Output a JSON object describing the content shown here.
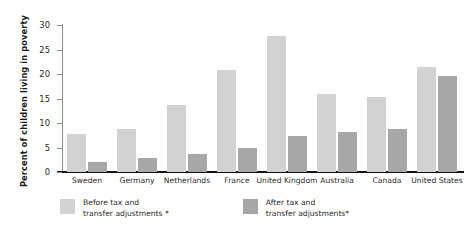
{
  "chart_data": {
    "type": "bar",
    "title": "",
    "xlabel": "",
    "ylabel": "Percent of children living in poverty",
    "ylim": [
      0,
      30
    ],
    "yticks": [
      0,
      5,
      10,
      15,
      20,
      25,
      30
    ],
    "grid": false,
    "legend_position": "bottom-left",
    "categories": [
      "Sweden",
      "Germany",
      "Netherlands",
      "France",
      "United Kingdom",
      "Australia",
      "Canada",
      "United States"
    ],
    "series": [
      {
        "name": "Before tax and\ntransfer adjustments *",
        "color": "#d2d2d2",
        "values": [
          7.8,
          8.8,
          13.7,
          20.8,
          27.8,
          15.9,
          15.3,
          21.4
        ]
      },
      {
        "name": "After tax and\ntransfer  adjustments*",
        "color": "#a7a7a7",
        "values": [
          2.0,
          2.9,
          3.7,
          4.8,
          7.4,
          8.2,
          8.8,
          19.5
        ]
      }
    ]
  },
  "axis": {
    "y_title": "Percent of children living in poverty",
    "tick_labels": [
      "0",
      "5",
      "10",
      "15",
      "20",
      "25",
      "30"
    ]
  },
  "legend": {
    "items": [
      {
        "label": "Before tax and\ntransfer adjustments *",
        "color": "#d2d2d2"
      },
      {
        "label": "After tax and\ntransfer  adjustments*",
        "color": "#a7a7a7"
      }
    ]
  }
}
